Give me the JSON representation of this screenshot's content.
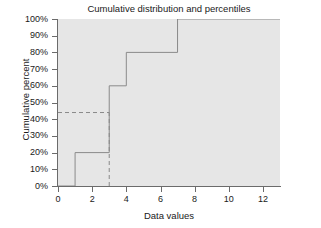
{
  "chart_data": {
    "type": "line",
    "title": "Cumulative distribution and percentiles",
    "xlabel": "Data values",
    "ylabel": "Cumulative percent",
    "xlim": [
      0,
      13
    ],
    "ylim": [
      0,
      100
    ],
    "grid": false,
    "legend": "none",
    "xticks": [
      0,
      2,
      4,
      6,
      8,
      10,
      12
    ],
    "xtick_labels": [
      "0",
      "2",
      "4",
      "6",
      "8",
      "10",
      "12"
    ],
    "yticks": [
      0,
      10,
      20,
      30,
      40,
      50,
      60,
      70,
      80,
      90,
      100
    ],
    "ytick_labels": [
      "0%",
      "10%",
      "20%",
      "30%",
      "40%",
      "50%",
      "60%",
      "70%",
      "80%",
      "90%",
      "100%"
    ],
    "series": [
      {
        "name": "Cumulative distribution",
        "style": "step-post",
        "x": [
          0,
          1,
          1,
          3,
          3,
          4,
          4,
          7,
          7,
          13
        ],
        "y": [
          0,
          0,
          20,
          20,
          60,
          60,
          80,
          80,
          100,
          100
        ]
      }
    ],
    "annotations": [
      {
        "name": "percentile-horizontal-guide",
        "style": "dashed",
        "x": [
          0,
          3
        ],
        "y": [
          44,
          44
        ]
      },
      {
        "name": "percentile-vertical-guide",
        "style": "dashed",
        "x": [
          3,
          3
        ],
        "y": [
          0,
          44
        ]
      }
    ],
    "colors": {
      "plot_background": "#e6e6e6",
      "figure_background": "#ffffff",
      "axis": "#6b6b6b",
      "step_line": "#8a8a8a",
      "guide_line": "#8a8a8a",
      "text": "#1a1a1a"
    }
  }
}
